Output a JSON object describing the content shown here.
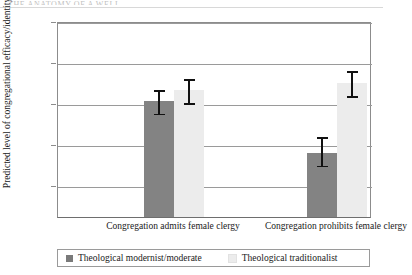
{
  "header": {
    "running_head": "THE ANATOMY OF A WELL"
  },
  "chart_data": {
    "type": "bar",
    "title": "",
    "xlabel": "",
    "ylabel": "Predicted level of congregational efficacy/identity",
    "ylim": [
      0.55,
      1.0
    ],
    "yticks": [
      1.0,
      0.9,
      0.8,
      0.7,
      0.6
    ],
    "ytick_labels": [
      "1.0",
      "0.9",
      "0.8",
      "0.7",
      "0.6"
    ],
    "grid": true,
    "legend_position": "bottom",
    "categories": [
      "Congregation admits female clergy",
      "Congregation prohibits female clergy"
    ],
    "series": [
      {
        "name": "Theological modernist/moderate",
        "color": "#838383",
        "values": [
          0.805,
          0.678
        ],
        "error_low": [
          0.775,
          0.648
        ],
        "error_high": [
          0.836,
          0.721
        ]
      },
      {
        "name": "Theological traditionalist",
        "color": "#ececec",
        "values": [
          0.831,
          0.849
        ],
        "error_low": [
          0.8,
          0.818
        ],
        "error_high": [
          0.863,
          0.882
        ]
      }
    ]
  },
  "legend": {
    "items": [
      {
        "label": "Theological modernist/moderate"
      },
      {
        "label": "Theological traditionalist"
      }
    ]
  }
}
